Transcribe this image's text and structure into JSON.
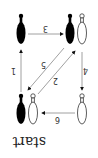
{
  "diagram": {
    "orientation": "rotated-180",
    "start_label": "start",
    "pins": [
      {
        "id": "state-top-left",
        "pins": [
          "black"
        ]
      },
      {
        "id": "state-top-right",
        "pins": [
          "black",
          "white"
        ]
      },
      {
        "id": "state-bottom-left",
        "pins": [
          "black",
          "white"
        ]
      },
      {
        "id": "state-bottom-right",
        "pins": [
          "white"
        ]
      }
    ],
    "edges": [
      {
        "label": "1",
        "from": "state-bottom-left",
        "to": "state-top-left"
      },
      {
        "label": "2",
        "from": "state-bottom-left",
        "to": "state-top-right"
      },
      {
        "label": "3",
        "from": "state-top-left",
        "to": "state-top-right"
      },
      {
        "label": "4",
        "from": "state-top-right",
        "to": "state-bottom-right"
      },
      {
        "label": "5",
        "from": "state-top-right",
        "to": "state-bottom-left"
      },
      {
        "label": "6",
        "from": "state-bottom-right",
        "to": "state-bottom-left"
      }
    ],
    "colors": {
      "line": "#888888",
      "pin_black": "#000000",
      "pin_white": "#ffffff",
      "pin_outline": "#333333"
    }
  }
}
